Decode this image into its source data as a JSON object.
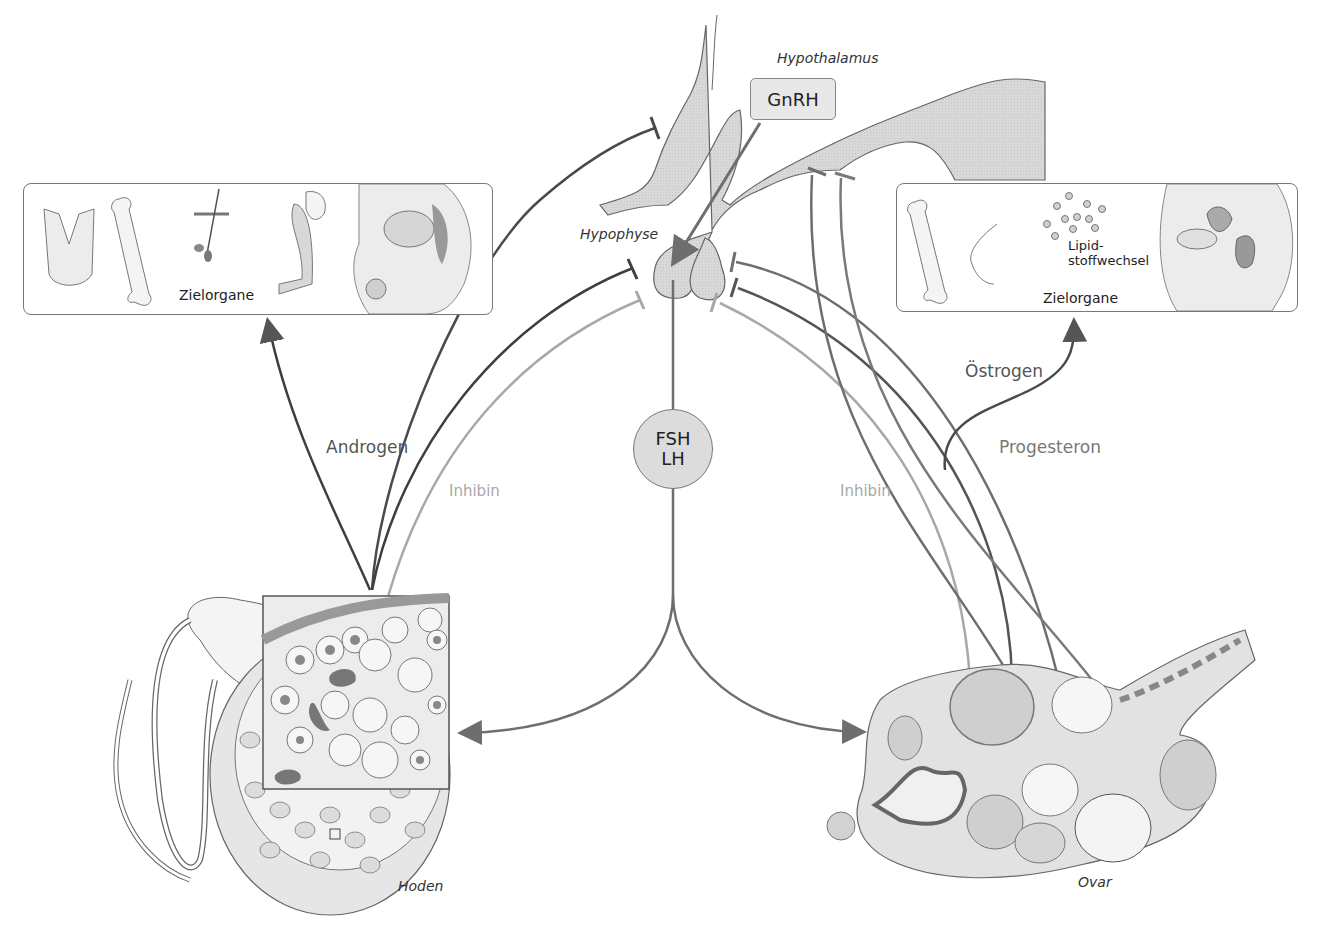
{
  "diagram": {
    "type": "hormone regulation feedback axis",
    "colors": {
      "organ_fill": "#d6d6d6",
      "organ_stroke": "#666666",
      "line_dark": "#3e3e3e",
      "line_mid": "#6e6e6e",
      "line_light": "#a8a8a8",
      "node_fill": "#dcdcdc"
    },
    "labels": {
      "hypothalamus": "Hypothalamus",
      "gnrh": "GnRH",
      "hypophyse": "Hypophyse",
      "fsh": "FSH",
      "lh": "LH",
      "androgen": "Androgen",
      "inhibin_left": "Inhibin",
      "inhibin_right": "Inhibin",
      "oestrogen": "Östrogen",
      "progesteron": "Progesteron",
      "hoden": "Hoden",
      "ovar": "Ovar"
    },
    "left_panel": {
      "caption": "Zielorgane",
      "items": [
        "larynx",
        "femur",
        "hair-follicle",
        "muscle-arm",
        "male-pelvis"
      ]
    },
    "right_panel": {
      "caption": "Zielorgane",
      "lipid_label_line1": "Lipid-",
      "lipid_label_line2": "stoffwechsel",
      "items": [
        "femur",
        "breast",
        "lipid-droplets",
        "female-pelvis"
      ]
    },
    "edges": [
      {
        "from": "GnRH",
        "to": "Hypophyse",
        "type": "stimulate"
      },
      {
        "from": "Hypophyse",
        "to": "FSH/LH",
        "type": "release"
      },
      {
        "from": "FSH/LH",
        "to": "Hoden",
        "type": "stimulate"
      },
      {
        "from": "FSH/LH",
        "to": "Ovar",
        "type": "stimulate"
      },
      {
        "from": "Hoden",
        "to": "Zielorgane (male)",
        "label": "Androgen",
        "type": "stimulate"
      },
      {
        "from": "Hoden",
        "to": "Hypophyse",
        "label": "Androgen",
        "type": "inhibit"
      },
      {
        "from": "Hoden",
        "to": "Hypothalamus",
        "label": "Androgen",
        "type": "inhibit"
      },
      {
        "from": "Hoden",
        "to": "Hypophyse",
        "label": "Inhibin",
        "type": "inhibit"
      },
      {
        "from": "Ovar",
        "to": "Hypophyse",
        "label": "Inhibin",
        "type": "inhibit"
      },
      {
        "from": "Ovar",
        "to": "Hypophyse",
        "label": "Östrogen",
        "type": "inhibit"
      },
      {
        "from": "Ovar",
        "to": "Hypothalamus",
        "label": "Östrogen/Progesteron",
        "type": "inhibit"
      },
      {
        "from": "Ovar",
        "to": "Zielorgane (female)",
        "label": "Östrogen",
        "type": "stimulate"
      }
    ]
  }
}
